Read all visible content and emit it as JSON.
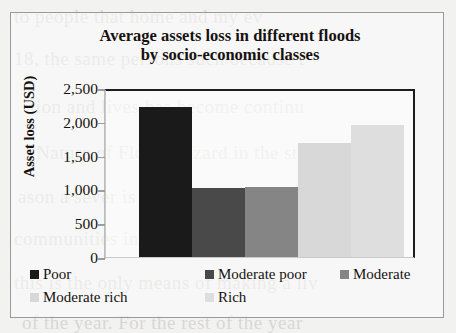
{
  "chart_data": {
    "type": "bar",
    "title": "Average assets loss in different floods by socio-economic classes",
    "title_lines": [
      "Average assets loss in different floods",
      "by socio-economic classes"
    ],
    "xlabel": "",
    "ylabel": "Asset loss (USD)",
    "ylim": [
      0,
      2500
    ],
    "ytick_labels": [
      "2,500",
      "2,000",
      "1,500",
      "1,000",
      "500",
      "0"
    ],
    "ytick_values": [
      2500,
      2000,
      1500,
      1000,
      500,
      0
    ],
    "grid": false,
    "legend_position": "bottom",
    "categories": [
      "Poor",
      "Moderate poor",
      "Moderate",
      "Moderate rich",
      "Rich"
    ],
    "values": [
      2220,
      1020,
      1040,
      1680,
      1960
    ],
    "colors": [
      "#1a1a1a",
      "#494949",
      "#858585",
      "#d8d8d8",
      "#dedede"
    ],
    "series": [
      {
        "name": "Asset loss (USD)",
        "values": [
          2220,
          1020,
          1040,
          1680,
          1960
        ]
      }
    ]
  },
  "legend": {
    "rows": [
      [
        {
          "label": "Poor",
          "color": "#1a1a1a"
        },
        {
          "label": "Moderate poor",
          "color": "#494949"
        },
        {
          "label": "Moderate",
          "color": "#858585"
        }
      ],
      [
        {
          "label": "Moderate rich",
          "color": "#d8d8d8"
        },
        {
          "label": "Rich",
          "color": "#dedede"
        }
      ]
    ]
  },
  "background_text": [
    {
      "text": "to people that home and my ev",
      "x": 14,
      "y": 6
    },
    {
      "text": "18, the same persons such because t",
      "x": 14,
      "y": 48
    },
    {
      "text": "tion and lives has become continu",
      "x": 30,
      "y": 96
    },
    {
      "text": "Nature of Flood Hazard in the study a",
      "x": 36,
      "y": 142
    },
    {
      "text": "ason a sever is a problem in rainy s",
      "x": 18,
      "y": 186
    },
    {
      "text": "communities in the area of the economic",
      "x": 14,
      "y": 228
    },
    {
      "text": "this is the only means of making a liv",
      "x": 14,
      "y": 272
    },
    {
      "text": "of the year. For the rest of the year",
      "x": 22,
      "y": 312
    }
  ]
}
